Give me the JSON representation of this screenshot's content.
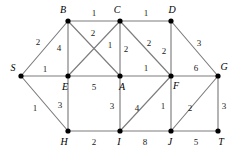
{
  "figure": {
    "background_color": "#ffffff",
    "edge_color": "#7d7d7d",
    "node_color": "#000000"
  },
  "chart_data": {
    "type": "diagram",
    "diagram_kind": "weighted-undirected-graph",
    "title": "",
    "xlabel": "",
    "ylabel": "",
    "nodes": [
      {
        "id": "S",
        "label": "S",
        "x": 21,
        "y": 76,
        "label_x": 13,
        "label_y": 68
      },
      {
        "id": "B",
        "label": "B",
        "x": 68,
        "y": 21,
        "label_x": 63,
        "label_y": 10
      },
      {
        "id": "C",
        "label": "C",
        "x": 120,
        "y": 21,
        "label_x": 117,
        "label_y": 10
      },
      {
        "id": "D",
        "label": "D",
        "x": 171,
        "y": 21,
        "label_x": 172,
        "label_y": 10
      },
      {
        "id": "E",
        "label": "E",
        "x": 68,
        "y": 76,
        "label_x": 65,
        "label_y": 87
      },
      {
        "id": "A",
        "label": "A",
        "x": 120,
        "y": 76,
        "label_x": 122,
        "label_y": 87
      },
      {
        "id": "F",
        "label": "F",
        "x": 171,
        "y": 76,
        "label_x": 176,
        "label_y": 86
      },
      {
        "id": "G",
        "label": "G",
        "x": 218,
        "y": 76,
        "label_x": 224,
        "label_y": 67
      },
      {
        "id": "H",
        "label": "H",
        "x": 68,
        "y": 131,
        "label_x": 64,
        "label_y": 142
      },
      {
        "id": "I",
        "label": "I",
        "x": 120,
        "y": 131,
        "label_x": 119,
        "label_y": 142
      },
      {
        "id": "J",
        "label": "J",
        "x": 171,
        "y": 131,
        "label_x": 170,
        "label_y": 142
      },
      {
        "id": "T",
        "label": "T",
        "x": 218,
        "y": 131,
        "label_x": 221,
        "label_y": 142
      }
    ],
    "edges": [
      {
        "from": "B",
        "to": "C",
        "weight": 1,
        "label_x": 94,
        "label_y": 13
      },
      {
        "from": "C",
        "to": "D",
        "weight": 1,
        "label_x": 146,
        "label_y": 13
      },
      {
        "from": "S",
        "to": "B",
        "weight": 2,
        "label_x": 38,
        "label_y": 42
      },
      {
        "from": "S",
        "to": "E",
        "weight": 1,
        "label_x": 45,
        "label_y": 69
      },
      {
        "from": "S",
        "to": "H",
        "weight": 1,
        "label_x": 35,
        "label_y": 108
      },
      {
        "from": "B",
        "to": "E",
        "weight": 4,
        "label_x": 59,
        "label_y": 48
      },
      {
        "from": "B",
        "to": "A",
        "weight": 2,
        "label_x": 93,
        "label_y": 33
      },
      {
        "from": "C",
        "to": "E",
        "weight": 1,
        "label_x": 110,
        "label_y": 45
      },
      {
        "from": "C",
        "to": "A",
        "weight": 2,
        "label_x": 126,
        "label_y": 49
      },
      {
        "from": "C",
        "to": "F",
        "weight": 2,
        "label_x": 149,
        "label_y": 43
      },
      {
        "from": "D",
        "to": "F",
        "weight": 2,
        "label_x": 164,
        "label_y": 51
      },
      {
        "from": "D",
        "to": "G",
        "weight": 3,
        "label_x": 199,
        "label_y": 43
      },
      {
        "from": "E",
        "to": "A",
        "weight": 5,
        "label_x": 94,
        "label_y": 87
      },
      {
        "from": "A",
        "to": "F",
        "weight": 1,
        "label_x": 146,
        "label_y": 68
      },
      {
        "from": "F",
        "to": "G",
        "weight": 6,
        "label_x": 196,
        "label_y": 68
      },
      {
        "from": "E",
        "to": "H",
        "weight": 3,
        "label_x": 60,
        "label_y": 105
      },
      {
        "from": "A",
        "to": "I",
        "weight": 3,
        "label_x": 112,
        "label_y": 106
      },
      {
        "from": "F",
        "to": "I",
        "weight": 4,
        "label_x": 137,
        "label_y": 108
      },
      {
        "from": "F",
        "to": "J",
        "weight": 1,
        "label_x": 163,
        "label_y": 106
      },
      {
        "from": "G",
        "to": "J",
        "weight": 2,
        "label_x": 190,
        "label_y": 108
      },
      {
        "from": "G",
        "to": "T",
        "weight": 3,
        "label_x": 224,
        "label_y": 106
      },
      {
        "from": "H",
        "to": "I",
        "weight": 2,
        "label_x": 94,
        "label_y": 142
      },
      {
        "from": "I",
        "to": "J",
        "weight": 8,
        "label_x": 145,
        "label_y": 142
      },
      {
        "from": "J",
        "to": "T",
        "weight": 5,
        "label_x": 196,
        "label_y": 142
      }
    ]
  }
}
